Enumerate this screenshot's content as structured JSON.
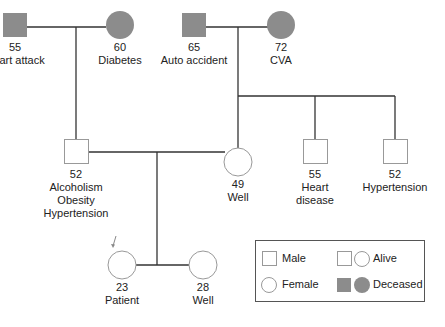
{
  "colors": {
    "deceased_fill": "#8c8c8c",
    "line": "#333333",
    "alive_stroke": "#999999"
  },
  "generation1": {
    "paternal_grandfather": {
      "sex": "male",
      "status": "deceased",
      "age": "55",
      "condition": "Heart attack"
    },
    "paternal_grandmother": {
      "sex": "female",
      "status": "deceased",
      "age": "60",
      "condition": "Diabetes"
    },
    "maternal_grandfather": {
      "sex": "male",
      "status": "deceased",
      "age": "65",
      "condition": "Auto accident"
    },
    "maternal_grandmother": {
      "sex": "female",
      "status": "deceased",
      "age": "72",
      "condition": "CVA"
    }
  },
  "generation2": {
    "father": {
      "sex": "male",
      "status": "alive",
      "age": "52",
      "conditions": [
        "Alcoholism",
        "Obesity",
        "Hypertension"
      ]
    },
    "mother": {
      "sex": "female",
      "status": "alive",
      "age": "49",
      "condition": "Well"
    },
    "maternal_uncle_1": {
      "sex": "male",
      "status": "alive",
      "age": "55",
      "conditions": [
        "Heart",
        "disease"
      ]
    },
    "maternal_uncle_2": {
      "sex": "male",
      "status": "alive",
      "age": "52",
      "condition": "Hypertension"
    }
  },
  "generation3": {
    "patient": {
      "sex": "female",
      "status": "alive",
      "age": "23",
      "condition": "Patient",
      "proband_arrow": true
    },
    "sister": {
      "sex": "female",
      "status": "alive",
      "age": "28",
      "condition": "Well"
    }
  },
  "legend": {
    "male": "Male",
    "female": "Female",
    "alive": "Alive",
    "deceased": "Deceased"
  }
}
